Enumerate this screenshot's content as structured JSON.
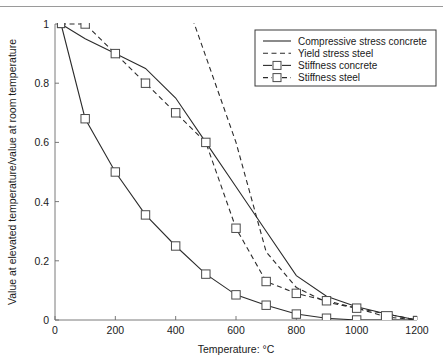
{
  "chart_data": {
    "type": "line",
    "title": "",
    "xlabel": "Temperature: °C",
    "ylabel": "Value at elevated temperature/value at room temperature",
    "xlim": [
      0,
      1200
    ],
    "ylim": [
      0,
      1
    ],
    "xticks": [
      0,
      200,
      400,
      600,
      800,
      1000,
      1200
    ],
    "xtick_labels": [
      "0",
      "200",
      "400",
      "600",
      "800",
      "1000",
      "1200"
    ],
    "yticks": [
      0,
      0.2,
      0.4,
      0.6,
      0.8,
      1
    ],
    "ytick_labels": [
      "0",
      "0.2",
      "0.4",
      "0.6",
      "0.8",
      "1"
    ],
    "grid": false,
    "legend_position": "upper right",
    "series": [
      {
        "name": "Compressive stress concrete",
        "style": "solid",
        "marker": "none",
        "x": [
          20,
          100,
          200,
          300,
          400,
          500,
          600,
          700,
          800,
          900,
          1000,
          1100,
          1200
        ],
        "y": [
          1.0,
          0.95,
          0.9,
          0.85,
          0.75,
          0.6,
          0.45,
          0.3,
          0.15,
          0.08,
          0.045,
          0.02,
          0.0
        ]
      },
      {
        "name": "Yield stress steel",
        "style": "dashed",
        "marker": "none",
        "x": [
          400,
          500,
          600,
          700,
          800,
          900,
          1000,
          1100,
          1200
        ],
        "y": [
          1.18,
          0.89,
          0.6,
          0.23,
          0.11,
          0.06,
          0.04,
          0.02,
          0.0
        ]
      },
      {
        "name": "Stiffness concrete",
        "style": "solid",
        "marker": "square",
        "x": [
          20,
          100,
          200,
          300,
          400,
          500,
          600,
          700,
          800,
          900,
          1000,
          1100,
          1200
        ],
        "y": [
          1.0,
          0.68,
          0.5,
          0.355,
          0.25,
          0.155,
          0.085,
          0.05,
          0.02,
          0.006,
          0.0,
          0.0,
          0.0
        ]
      },
      {
        "name": "Stiffness steel",
        "style": "dashed",
        "marker": "square",
        "x": [
          20,
          100,
          200,
          300,
          400,
          500,
          600,
          700,
          800,
          900,
          1000,
          1100,
          1200
        ],
        "y": [
          1.0,
          1.0,
          0.9,
          0.8,
          0.7,
          0.6,
          0.31,
          0.13,
          0.09,
          0.065,
          0.04,
          0.01,
          0.0
        ]
      }
    ]
  },
  "legend": {
    "items": [
      {
        "label": "Compressive stress concrete",
        "style": "solid",
        "marker": "none"
      },
      {
        "label": "Yield stress steel",
        "style": "dashed",
        "marker": "none"
      },
      {
        "label": "Stiffness concrete",
        "style": "solid",
        "marker": "square"
      },
      {
        "label": "Stiffness steel",
        "style": "dashed",
        "marker": "square"
      }
    ]
  },
  "colors": {
    "line": "#2b2b2b",
    "axis": "#6b6b6b",
    "marker_fill": "#ffffff",
    "marker_stroke": "#4a4a4a",
    "background": "#ffffff"
  }
}
